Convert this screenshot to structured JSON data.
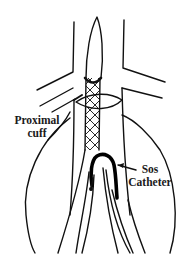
{
  "diagram": {
    "labels": {
      "proximal_cuff": {
        "line1": "Proximal",
        "line2": "cuff"
      },
      "sos_catheter": {
        "line1": "Sos",
        "line2": "Catheter"
      }
    },
    "colors": {
      "stroke": "#111111",
      "background": "#ffffff",
      "text": "#1a1a1a"
    }
  }
}
